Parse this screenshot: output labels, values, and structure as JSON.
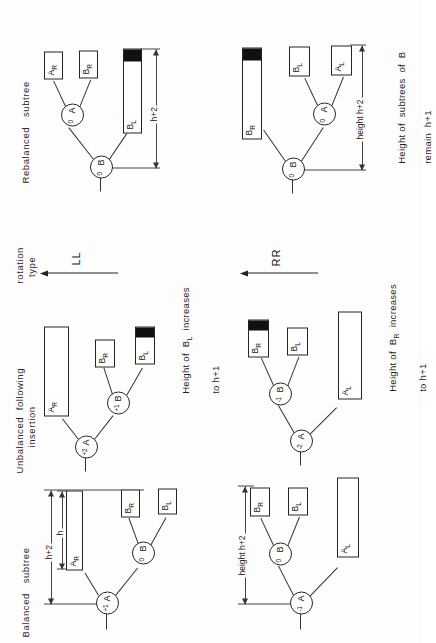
{
  "figure": {
    "orientation_deg": -90,
    "ink_color": "#222222",
    "paper_color": "#fdfdfd",
    "fill_color": "#111111"
  },
  "columns": [
    {
      "id": "balanced",
      "label": "Balanced   subtree"
    },
    {
      "id": "unbalanced",
      "label": "Unbalanced  following\n        insertion"
    },
    {
      "id": "rotation",
      "label": "rotation\n  type"
    },
    {
      "id": "rebalanced",
      "label": "Rebalanced   subtree"
    }
  ],
  "rows": [
    {
      "id": "LL",
      "rotation_label": "LL",
      "balanced": {
        "root": {
          "name": "A",
          "balance": "+1"
        },
        "child": {
          "name": "B",
          "balance": "0"
        },
        "boxes": [
          {
            "name": "A_R",
            "label": "A",
            "sub": "R",
            "filled": false
          },
          {
            "name": "B_L",
            "label": "B",
            "sub": "L",
            "filled": false
          },
          {
            "name": "B_R",
            "label": "B",
            "sub": "R",
            "filled": false
          }
        ],
        "dimensions": [
          {
            "label": "h+2"
          },
          {
            "label": "h"
          }
        ]
      },
      "unbalanced": {
        "root": {
          "name": "A",
          "balance": "+2"
        },
        "child": {
          "name": "B",
          "balance": "+1"
        },
        "boxes": [
          {
            "name": "A_R",
            "label": "A",
            "sub": "R",
            "filled": false
          },
          {
            "name": "B_L",
            "label": "B",
            "sub": "L",
            "filled": true
          },
          {
            "name": "B_R",
            "label": "B",
            "sub": "R",
            "filled": false
          }
        ],
        "caption": "Height of  B   increases\n                 L\n       to h+1",
        "caption_main": "Height of  B",
        "caption_sub": "L",
        "caption_tail": "  increases",
        "caption_line2": "to h+1"
      },
      "rebalanced": {
        "root": {
          "name": "B",
          "balance": "0"
        },
        "child": {
          "name": "A",
          "balance": "0"
        },
        "boxes": [
          {
            "name": "B_L",
            "label": "B",
            "sub": "L",
            "filled": true
          },
          {
            "name": "B_R",
            "label": "B",
            "sub": "R",
            "filled": false
          },
          {
            "name": "A_R",
            "label": "A",
            "sub": "R",
            "filled": false
          }
        ],
        "dimensions": [
          {
            "label": "h+2"
          }
        ]
      }
    },
    {
      "id": "RR",
      "rotation_label": "RR",
      "balanced": {
        "root": {
          "name": "A",
          "balance": "-1"
        },
        "child": {
          "name": "B",
          "balance": "0"
        },
        "boxes": [
          {
            "name": "A_L",
            "label": "A",
            "sub": "L",
            "filled": false
          },
          {
            "name": "B_L",
            "label": "B",
            "sub": "L",
            "filled": false
          },
          {
            "name": "B_R",
            "label": "B",
            "sub": "R",
            "filled": false
          }
        ],
        "dimensions": [
          {
            "label": "height  h+2"
          }
        ]
      },
      "unbalanced": {
        "root": {
          "name": "A",
          "balance": "-2"
        },
        "child": {
          "name": "B",
          "balance": "-1"
        },
        "boxes": [
          {
            "name": "A_L",
            "label": "A",
            "sub": "L",
            "filled": false
          },
          {
            "name": "B_L",
            "label": "B",
            "sub": "L",
            "filled": false
          },
          {
            "name": "B_R",
            "label": "B",
            "sub": "R",
            "filled": true
          }
        ],
        "caption_main": "Height of  B",
        "caption_sub": "R",
        "caption_tail": "  increases",
        "caption_line2": "to h+1"
      },
      "rebalanced": {
        "root": {
          "name": "B",
          "balance": "0"
        },
        "child": {
          "name": "A",
          "balance": "0"
        },
        "boxes": [
          {
            "name": "B_R",
            "label": "B",
            "sub": "R",
            "filled": true
          },
          {
            "name": "A_L",
            "label": "A",
            "sub": "L",
            "filled": false
          },
          {
            "name": "B_L",
            "label": "B",
            "sub": "L",
            "filled": false
          }
        ],
        "dimensions": [
          {
            "label": "height  h+2"
          }
        ],
        "caption_main": "Height of  subtrees  of  B",
        "caption_line2": "remain  h+1"
      }
    }
  ]
}
